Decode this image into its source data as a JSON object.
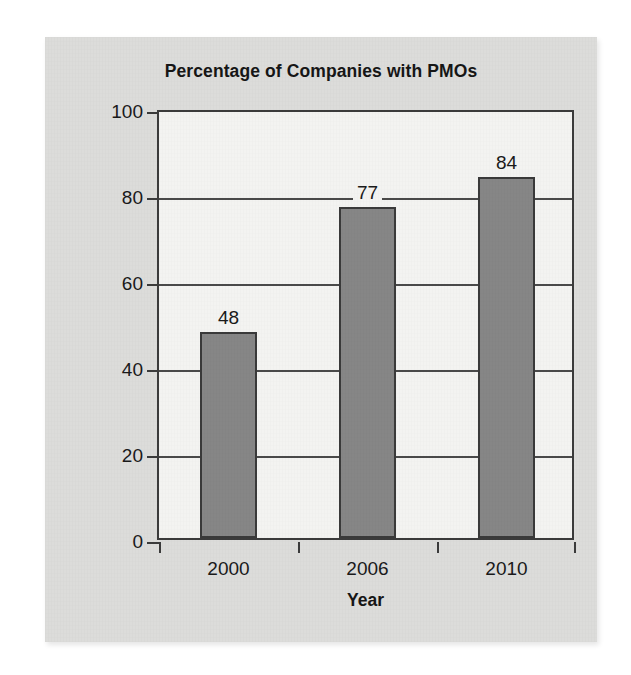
{
  "figure": {
    "panel_background": "#dcdcda",
    "page_background": "#ffffff"
  },
  "chart_data": {
    "type": "bar",
    "title": "Percentage of Companies with PMOs",
    "xlabel": "Year",
    "ylabel": "Percentage",
    "categories": [
      "2000",
      "2006",
      "2010"
    ],
    "values": [
      48,
      77,
      84
    ],
    "value_labels": [
      "48",
      "77",
      "84"
    ],
    "ylim": [
      0,
      100
    ],
    "yticks": [
      0,
      20,
      40,
      60,
      80,
      100
    ],
    "ytick_labels": [
      "0",
      "20",
      "40",
      "60",
      "80",
      "100"
    ],
    "grid": true,
    "grid_axis": "y",
    "legend": false,
    "bar_color": "#868686",
    "bar_border_color": "#3a3a3a",
    "plot_background": "#f3f3f1",
    "axis_color": "#3b3b3b",
    "text_color": "#1a1a1a"
  }
}
